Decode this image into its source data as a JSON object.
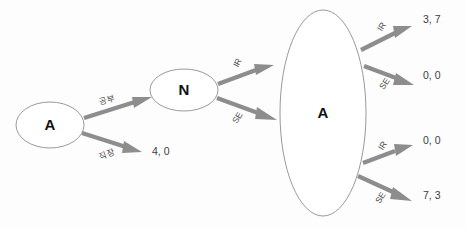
{
  "diagram": {
    "type": "extensive-form-game-tree",
    "nodes": [
      {
        "id": "root-a",
        "label": "A",
        "shape": "ellipse",
        "cx": 50,
        "cy": 125,
        "rx": 34,
        "ry": 23
      },
      {
        "id": "nature-n",
        "label": "N",
        "shape": "ellipse",
        "cx": 184,
        "cy": 90,
        "rx": 34,
        "ry": 21
      },
      {
        "id": "infoset-a",
        "label": "A",
        "shape": "ellipse",
        "cx": 323,
        "cy": 113,
        "rx": 43,
        "ry": 103
      }
    ],
    "edges": [
      {
        "id": "e1",
        "from": "root-a",
        "to": "nature-n",
        "label": "공부"
      },
      {
        "id": "e2",
        "from": "root-a",
        "to": "payoff-1",
        "label": "직장"
      },
      {
        "id": "e3",
        "from": "nature-n",
        "to": "infoset-a-top",
        "label": "IR"
      },
      {
        "id": "e4",
        "from": "nature-n",
        "to": "infoset-a-bottom",
        "label": "SE"
      },
      {
        "id": "e5",
        "from": "infoset-a",
        "to": "payoff-2",
        "label": "IR"
      },
      {
        "id": "e6",
        "from": "infoset-a",
        "to": "payoff-3",
        "label": "SE"
      },
      {
        "id": "e7",
        "from": "infoset-a",
        "to": "payoff-4",
        "label": "IR"
      },
      {
        "id": "e8",
        "from": "infoset-a",
        "to": "payoff-5",
        "label": "SE"
      }
    ],
    "payoffs": [
      {
        "id": "payoff-1",
        "text": "4, 0",
        "x": 152,
        "y": 152
      },
      {
        "id": "payoff-2",
        "text": "3, 7",
        "x": 423,
        "y": 20
      },
      {
        "id": "payoff-3",
        "text": "0, 0",
        "x": 423,
        "y": 76
      },
      {
        "id": "payoff-4",
        "text": "0, 0",
        "x": 423,
        "y": 141
      },
      {
        "id": "payoff-5",
        "text": "7, 3",
        "x": 423,
        "y": 196
      }
    ],
    "colors": {
      "background": "#fdfdfd",
      "node_stroke": "#9a9a9a",
      "node_fill": "#ffffff",
      "edge": "#8d8d8d",
      "node_text": "#111111",
      "edge_text": "#4a4a4a",
      "payoff_text": "#3c3c3c"
    }
  }
}
